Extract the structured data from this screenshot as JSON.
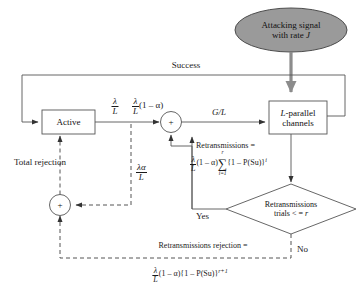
{
  "diagram": {
    "colors": {
      "stroke": "#555555",
      "text": "#1a1a1a",
      "ellipse_fill": "#9a9a9a",
      "ellipse_stroke": "#4d4d4d",
      "attack_arrow": "#8c8c8c",
      "background": "#ffffff"
    },
    "nodes": {
      "attack_ellipse": {
        "line1": "Attacking signal",
        "line2_pre": "with rate ",
        "line2_sym": "J"
      },
      "active_box": {
        "label": "Active"
      },
      "channels_box": {
        "line1_sym": "L",
        "line1_rest": "-parallel",
        "line2": "channels"
      },
      "decision": {
        "line1": "Retransmissions",
        "line2_pre": "trials < = ",
        "line2_sym": "r"
      },
      "sum_top": {
        "symbol": "+"
      },
      "sum_bottom": {
        "symbol": "+"
      }
    },
    "edge_labels": {
      "success": "Success",
      "lambda_over_L": {
        "num": "λ",
        "den": "L"
      },
      "lambda_over_L_1ma": {
        "num": "λ",
        "den": "L",
        "rest": "(1 – α)"
      },
      "g_over_l": "G/L",
      "total_rejection": "Total rejection",
      "lambda_alpha_over_L": {
        "num": "λα",
        "den": "L"
      },
      "yes": "Yes",
      "no": "No"
    },
    "formulas": {
      "retransmissions": {
        "heading": "Retransmissions =",
        "num": "λ",
        "den": "L",
        "factor": "(1 – α)",
        "sum_top": "r",
        "sum_bottom": "i=1",
        "sum_sign": "∑",
        "body": "{1 – P(Su)}",
        "exponent": "i"
      },
      "retransmissions_rejection": {
        "heading": "Retransmissions rejection =",
        "num": "λ",
        "den": "L",
        "factor": "(1 – α)",
        "body": "{1 – P(Su)}",
        "exponent": "r+1"
      }
    }
  }
}
